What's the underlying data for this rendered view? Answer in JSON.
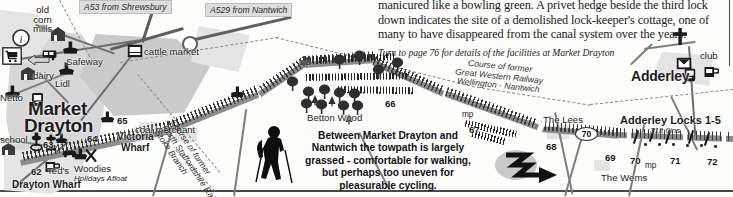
{
  "article": {
    "lines": [
      "manicured like a bowling green. A privet hedge beside the third lock",
      "down indicates the site of a demolished lock-keeper's cottage, one of",
      "many to have disappeared from the canal system over the years."
    ],
    "turn_to": "Turn to page 76 for details of the facilities at Market Drayton"
  },
  "caption": {
    "lines": [
      "Between Market Drayton and",
      "Nantwich the towpath is largely",
      "grassed - comfortable for walking,",
      "but perhaps too uneven for",
      "pleasurable cycling."
    ]
  },
  "road_labels": [
    {
      "name": "a53-label",
      "text": "A53 from Shrewsbury"
    },
    {
      "name": "a529-label",
      "text": "A529 from Nantwich"
    }
  ],
  "places": {
    "market_drayton_line1": "Market",
    "market_drayton_line2": "Drayton",
    "adderley": "Adderley"
  },
  "map_labels": [
    {
      "name": "old-corn-mills-label",
      "text": "old\ncorn\nmills"
    },
    {
      "name": "safeway-label",
      "text": "Safeway"
    },
    {
      "name": "lidl-label",
      "text": "Lidl"
    },
    {
      "name": "netto-label",
      "text": "Netto"
    },
    {
      "name": "dairy-label",
      "text": "dairy"
    },
    {
      "name": "school-label",
      "text": "school"
    },
    {
      "name": "cattle-market-label",
      "text": "cattle market"
    },
    {
      "name": "victoria-wharf-label-1",
      "text": "Victoria"
    },
    {
      "name": "victoria-wharf-label-2",
      "text": "Wharf"
    },
    {
      "name": "coal-merchant-label",
      "text": "coal merchant"
    },
    {
      "name": "drayton-wharf-label",
      "text": "Drayton Wharf"
    },
    {
      "name": "teds-label",
      "text": "Ted's"
    },
    {
      "name": "woodies-label-1",
      "text": "Woodies"
    },
    {
      "name": "woodies-label-2",
      "text": "Holidays Afloat"
    },
    {
      "name": "betton-wood-label",
      "text": "Betton Wood"
    },
    {
      "name": "the-lees-label",
      "text": "The Lees"
    },
    {
      "name": "the-wems-label",
      "text": "The Wems"
    },
    {
      "name": "club-label",
      "text": "club"
    }
  ],
  "lock_group": {
    "title": "Adderley Locks 1-5",
    "rise": "31ft 0ins"
  },
  "railway_courses": [
    {
      "name": "great-western-railway-course",
      "lines": [
        "Course of former",
        "Great Western Railway",
        "Wellington - Nantwich"
      ]
    },
    {
      "name": "north-staffordshire-railway-course",
      "lines": [
        "Course of former",
        "North Staffordshire Railway",
        "Stoke Branch"
      ]
    }
  ],
  "bridge_numbers": [
    "62",
    "63",
    "64",
    "65",
    "66",
    "67",
    "68",
    "69",
    "70",
    "71",
    "72"
  ],
  "mileposts": [
    "mp",
    "mp",
    "mp"
  ],
  "oval_marker": "70",
  "icons": [
    {
      "name": "information-icon"
    },
    {
      "name": "shopping-trolley-icon"
    },
    {
      "name": "windlass-icon"
    },
    {
      "name": "bus-icon"
    },
    {
      "name": "telephone-icon"
    },
    {
      "name": "post-box-icon"
    },
    {
      "name": "public-house-icon"
    },
    {
      "name": "restaurant-icon"
    },
    {
      "name": "car-park-icon"
    },
    {
      "name": "water-point-icon"
    },
    {
      "name": "church-icon"
    },
    {
      "name": "boatyard-icon"
    },
    {
      "name": "walker-icon"
    },
    {
      "name": "flow-arrow-icon"
    }
  ],
  "colors": {
    "paper": "#fdfdfc",
    "canal": "#8c8c8c",
    "urban": "#d7d7d7",
    "road": "#6e6e6e",
    "ink": "#1d1d1d"
  }
}
